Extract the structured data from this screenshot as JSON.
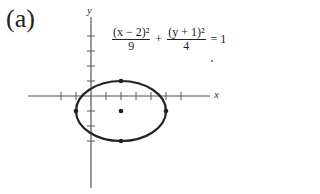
{
  "figure": {
    "panel_label": "(a)",
    "axes": {
      "x_label": "x",
      "y_label": "y"
    },
    "equation": {
      "term1_numerator": "(x − 2)²",
      "term1_denominator": "9",
      "plus": "+",
      "term2_numerator": "(y + 1)²",
      "term2_denominator": "4",
      "rhs": "= 1"
    },
    "ellipse": {
      "center": [
        2,
        -1
      ],
      "a": 3,
      "b": 2,
      "vertices": [
        [
          -1,
          -1
        ],
        [
          5,
          -1
        ]
      ],
      "co_vertices": [
        [
          2,
          1
        ],
        [
          2,
          -3
        ]
      ]
    },
    "colors": {
      "ink": "#222222",
      "axis": "#555555"
    }
  }
}
